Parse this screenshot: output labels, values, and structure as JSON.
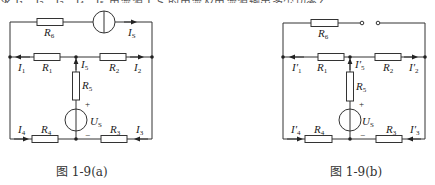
{
  "top_text": "求 I₁、I₂、I₃、I₄、I₅ 电流源 I_S 的电流及电流源输出多少功率？",
  "figures": [
    {
      "id": "a",
      "caption": "图 1-9(a)",
      "components": {
        "R6": {
          "name": "R",
          "sub": "6"
        },
        "IS": {
          "name": "I",
          "sub": "S"
        },
        "R1": {
          "name": "R",
          "sub": "1"
        },
        "R2": {
          "name": "R",
          "sub": "2"
        },
        "R3": {
          "name": "R",
          "sub": "3"
        },
        "R4": {
          "name": "R",
          "sub": "4"
        },
        "R5": {
          "name": "R",
          "sub": "5"
        },
        "US": {
          "name": "U",
          "sub": "S"
        }
      },
      "currents": {
        "I1": {
          "name": "I",
          "sub": "1"
        },
        "I2": {
          "name": "I",
          "sub": "2"
        },
        "I3": {
          "name": "I",
          "sub": "3"
        },
        "I4": {
          "name": "I",
          "sub": "4"
        },
        "I5": {
          "name": "I",
          "sub": "5"
        }
      },
      "polarity": {
        "plus": "+",
        "minus": "−"
      }
    },
    {
      "id": "b",
      "caption": "图 1-9(b)",
      "components": {
        "R6": {
          "name": "R",
          "sub": "6"
        },
        "R1": {
          "name": "R",
          "sub": "1"
        },
        "R2": {
          "name": "R",
          "sub": "2"
        },
        "R3": {
          "name": "R",
          "sub": "3"
        },
        "R4": {
          "name": "R",
          "sub": "4"
        },
        "R5": {
          "name": "R",
          "sub": "5"
        },
        "US": {
          "name": "U",
          "sub": "S"
        }
      },
      "currents": {
        "I1": {
          "name": "I′",
          "sub": "1"
        },
        "I2": {
          "name": "I′",
          "sub": "2"
        },
        "I3": {
          "name": "I′",
          "sub": "3"
        },
        "I4": {
          "name": "I′",
          "sub": "4"
        },
        "I5": {
          "name": "I′",
          "sub": "5"
        }
      },
      "polarity": {
        "plus": "+",
        "minus": "−"
      }
    }
  ]
}
